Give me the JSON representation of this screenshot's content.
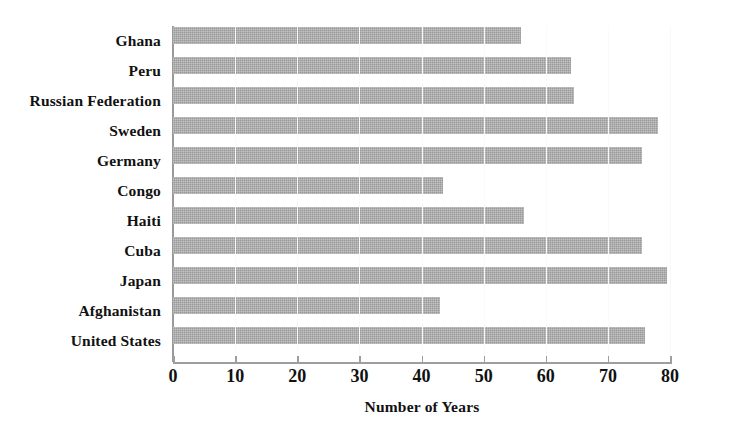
{
  "chart_data": {
    "type": "bar",
    "orientation": "horizontal",
    "title": "",
    "xlabel": "Number of Years",
    "ylabel": "",
    "xlim": [
      0,
      80
    ],
    "xticks": [
      0,
      10,
      20,
      30,
      40,
      50,
      60,
      70,
      80
    ],
    "grid": true,
    "legend": null,
    "bar_color": "#a9a9a9",
    "background_color": "#ffffff",
    "categories": [
      "Ghana",
      "Peru",
      "Russian Federation",
      "Sweden",
      "Germany",
      "Congo",
      "Haiti",
      "Cuba",
      "Japan",
      "Afghanistan",
      "United States"
    ],
    "values": [
      56,
      64,
      64.5,
      78,
      75.5,
      43.5,
      56.5,
      75.5,
      79.5,
      43,
      76
    ]
  }
}
